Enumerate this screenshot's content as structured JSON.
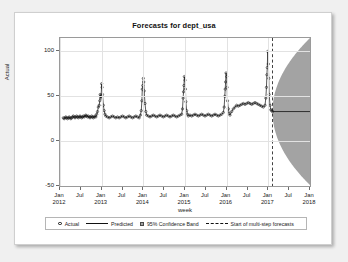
{
  "chart_data": {
    "type": "line",
    "title": "Forecasts for dept_usa",
    "xlabel": "week",
    "ylabel": "Actual",
    "ylim": [
      -50,
      115
    ],
    "yticks": [
      -50,
      0,
      50,
      100
    ],
    "ytick_labels": [
      "-50",
      "0",
      "50",
      "100"
    ],
    "xlim": [
      "2012-01",
      "2018-01"
    ],
    "xticks": [
      "2012-01",
      "2012-07",
      "2013-01",
      "2013-07",
      "2014-01",
      "2014-07",
      "2015-01",
      "2015-07",
      "2016-01",
      "2016-07",
      "2017-01",
      "2017-07",
      "2018-01"
    ],
    "xtick_labels": [
      {
        "month": "Jan",
        "year": "2012"
      },
      {
        "month": "Jul",
        "year": ""
      },
      {
        "month": "Jan",
        "year": "2013"
      },
      {
        "month": "Jul",
        "year": ""
      },
      {
        "month": "Jan",
        "year": "2014"
      },
      {
        "month": "Jul",
        "year": ""
      },
      {
        "month": "Jan",
        "year": "2015"
      },
      {
        "month": "Jul",
        "year": ""
      },
      {
        "month": "Jan",
        "year": "2016"
      },
      {
        "month": "Jul",
        "year": ""
      },
      {
        "month": "Jan",
        "year": "2017"
      },
      {
        "month": "Jul",
        "year": ""
      },
      {
        "month": "Jan",
        "year": "2018"
      }
    ],
    "grid": "vertical-and-horizontal-light",
    "legend_position": "bottom",
    "forecast_start": "2017-02",
    "forecast_mean_level": 33,
    "band_color": "#a3a3a3",
    "line_color": "#111111",
    "marker_color": "#111111",
    "series": [
      {
        "name": "Actual",
        "style": "open-circle-markers",
        "description": "Weekly actuals, baseline ~25-30 with sharp annual holiday spikes each December/January",
        "x": [
          0.08,
          0.1,
          0.12,
          0.14,
          0.16,
          0.18,
          0.2,
          0.22,
          0.24,
          0.26,
          0.28,
          0.3,
          0.32,
          0.34,
          0.36,
          0.38,
          0.4,
          0.42,
          0.44,
          0.46,
          0.48,
          0.5,
          0.52,
          0.54,
          0.56,
          0.58,
          0.6,
          0.62,
          0.64,
          0.66,
          0.68,
          0.7,
          0.72,
          0.74,
          0.76,
          0.78,
          0.8,
          0.82,
          0.84,
          0.86,
          0.88,
          0.9,
          0.92,
          0.94,
          0.955,
          0.965,
          0.975,
          0.985,
          1.0,
          1.01,
          1.02,
          1.04,
          1.06,
          1.08,
          1.1,
          1.14,
          1.18,
          1.22,
          1.26,
          1.3,
          1.34,
          1.38,
          1.42,
          1.46,
          1.5,
          1.54,
          1.58,
          1.62,
          1.66,
          1.7,
          1.74,
          1.78,
          1.82,
          1.86,
          1.9,
          1.93,
          1.95,
          1.965,
          1.975,
          1.985,
          2.0,
          2.01,
          2.02,
          2.04,
          2.06,
          2.08,
          2.12,
          2.16,
          2.2,
          2.24,
          2.28,
          2.32,
          2.36,
          2.4,
          2.44,
          2.48,
          2.52,
          2.56,
          2.6,
          2.64,
          2.68,
          2.72,
          2.76,
          2.8,
          2.84,
          2.88,
          2.92,
          2.94,
          2.955,
          2.965,
          2.975,
          2.985,
          3.0,
          3.01,
          3.02,
          3.04,
          3.06,
          3.08,
          3.12,
          3.16,
          3.2,
          3.24,
          3.28,
          3.32,
          3.36,
          3.4,
          3.44,
          3.48,
          3.52,
          3.56,
          3.6,
          3.64,
          3.68,
          3.72,
          3.76,
          3.8,
          3.84,
          3.88,
          3.92,
          3.94,
          3.955,
          3.965,
          3.975,
          3.985,
          4.0,
          4.01,
          4.02,
          4.04,
          4.06,
          4.08,
          4.12,
          4.16,
          4.2,
          4.24,
          4.28,
          4.32,
          4.36,
          4.4,
          4.44,
          4.48,
          4.52,
          4.56,
          4.6,
          4.64,
          4.68,
          4.72,
          4.76,
          4.8,
          4.84,
          4.88,
          4.92,
          4.94,
          4.955,
          4.965,
          4.975,
          4.985,
          5.0,
          5.01,
          5.02,
          5.04,
          5.06,
          5.08,
          5.1
        ],
        "y": [
          26,
          25,
          26,
          27,
          26,
          25,
          26,
          27,
          26,
          25,
          26,
          27,
          28,
          27,
          26,
          27,
          28,
          27,
          26,
          27,
          28,
          27,
          26,
          27,
          28,
          27,
          28,
          29,
          28,
          27,
          28,
          27,
          26,
          27,
          28,
          27,
          26,
          27,
          28,
          27,
          30,
          33,
          38,
          40,
          45,
          52,
          50,
          48,
          64,
          60,
          52,
          40,
          34,
          30,
          28,
          27,
          26,
          27,
          28,
          27,
          26,
          27,
          26,
          27,
          28,
          27,
          26,
          27,
          28,
          27,
          26,
          27,
          28,
          27,
          26,
          29,
          34,
          45,
          58,
          62,
          70,
          66,
          56,
          42,
          33,
          29,
          28,
          27,
          28,
          29,
          28,
          27,
          28,
          29,
          28,
          27,
          28,
          29,
          28,
          27,
          28,
          29,
          28,
          27,
          28,
          29,
          30,
          36,
          48,
          55,
          62,
          72,
          68,
          58,
          44,
          34,
          30,
          28,
          29,
          28,
          29,
          30,
          29,
          28,
          29,
          30,
          29,
          28,
          29,
          30,
          29,
          28,
          29,
          30,
          29,
          28,
          29,
          30,
          32,
          38,
          50,
          58,
          66,
          76,
          72,
          60,
          45,
          36,
          31,
          29,
          33,
          36,
          38,
          40,
          39,
          40,
          41,
          42,
          41,
          42,
          43,
          42,
          41,
          42,
          43,
          42,
          41,
          40,
          39,
          38,
          40,
          48,
          60,
          74,
          82,
          100,
          86,
          70,
          52,
          40,
          35,
          34,
          33
        ]
      },
      {
        "name": "Predicted",
        "style": "solid-line",
        "description": "Fitted values tracking actuals, then flat multi-step forecast at ~33 after Feb 2017"
      },
      {
        "name": "95% Confidence Band",
        "style": "filled-gray-region",
        "description": "Fan-shaped band widening from forecast start, reaching about -50 to 115 by Jan 2018"
      },
      {
        "name": "Start of multi-step forecasts",
        "style": "vertical-dashed-line",
        "description": "Dashed vertical reference line at forecast origin"
      }
    ]
  },
  "legend": {
    "items": [
      {
        "label": "Actual",
        "symbol": "open-circle"
      },
      {
        "label": "Predicted",
        "symbol": "solid-line"
      },
      {
        "label": "95% Confidence Band",
        "symbol": "filled-square"
      },
      {
        "label": "Start of multi-step forecasts",
        "symbol": "dashed-line"
      }
    ]
  }
}
